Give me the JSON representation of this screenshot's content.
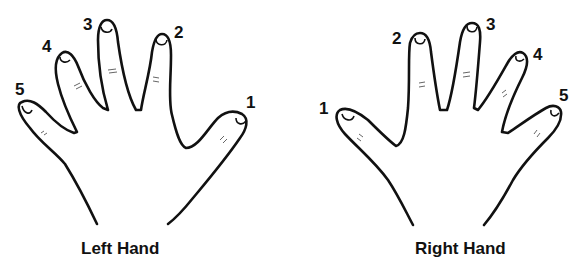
{
  "diagram": {
    "left_hand": {
      "caption": "Left Hand",
      "finger_labels": {
        "thumb": "1",
        "index": "2",
        "middle": "3",
        "ring": "4",
        "pinky": "5"
      }
    },
    "right_hand": {
      "caption": "Right Hand",
      "finger_labels": {
        "thumb": "1",
        "index": "2",
        "middle": "3",
        "ring": "4",
        "pinky": "5"
      }
    },
    "colors": {
      "line": "#111111",
      "background": "#ffffff"
    }
  }
}
